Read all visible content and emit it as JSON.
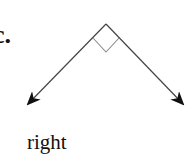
{
  "figure": {
    "part_label": "c.",
    "caption": "right",
    "angle_type": "right angle",
    "colors": {
      "rays": "#444444",
      "right_angle_marker": "#8a8a8a",
      "text": "#111111"
    },
    "geometry": {
      "vertex": [
        106,
        24
      ],
      "left_ray_end": [
        27,
        105
      ],
      "right_ray_end": [
        184,
        105
      ],
      "marker": [
        [
          93,
          38
        ],
        [
          106,
          52
        ],
        [
          119,
          38
        ]
      ]
    }
  }
}
